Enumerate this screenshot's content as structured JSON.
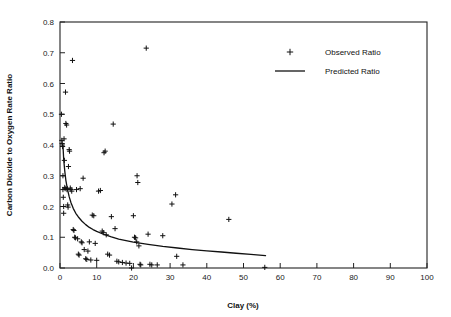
{
  "chart_data": {
    "type": "scatter",
    "title": "",
    "xlabel": "Clay (%)",
    "ylabel": "Carbon Dioxide to Oxygen Rate Ratio",
    "xlim": [
      0,
      100
    ],
    "ylim": [
      0.0,
      0.8
    ],
    "xticks": [
      0,
      10,
      20,
      30,
      40,
      50,
      60,
      70,
      80,
      90,
      100
    ],
    "xtick_labels": [
      "0",
      "10",
      "20",
      "30",
      "40",
      "50",
      "60",
      "70",
      "80",
      "90",
      "100"
    ],
    "yticks": [
      0.0,
      0.1,
      0.2,
      0.3,
      0.4,
      0.5,
      0.6,
      0.7,
      0.8
    ],
    "ytick_labels": [
      "0.0",
      "0.1",
      "0.2",
      "0.3",
      "0.4",
      "0.5",
      "0.6",
      "0.7",
      "0.8"
    ],
    "grid": false,
    "legend_position": "upper-right",
    "frame": true,
    "tick_direction": "in",
    "marker_symbol": "plus",
    "series": [
      {
        "name": "Observed Ratio",
        "type": "scatter",
        "marker": "plus",
        "color": "#111111",
        "points": [
          [
            0.4,
            0.5
          ],
          [
            0.5,
            0.415
          ],
          [
            0.6,
            0.405
          ],
          [
            0.7,
            0.395
          ],
          [
            0.8,
            0.3
          ],
          [
            0.8,
            0.255
          ],
          [
            0.9,
            0.23
          ],
          [
            1.0,
            0.2
          ],
          [
            1.0,
            0.178
          ],
          [
            1.1,
            0.42
          ],
          [
            1.2,
            0.35
          ],
          [
            1.3,
            0.262
          ],
          [
            1.4,
            0.258
          ],
          [
            1.5,
            0.572
          ],
          [
            1.6,
            0.47
          ],
          [
            1.8,
            0.465
          ],
          [
            1.9,
            0.255
          ],
          [
            2.0,
            0.258
          ],
          [
            2.1,
            0.205
          ],
          [
            2.2,
            0.198
          ],
          [
            2.3,
            0.33
          ],
          [
            2.5,
            0.385
          ],
          [
            2.6,
            0.38
          ],
          [
            2.8,
            0.26
          ],
          [
            3.0,
            0.255
          ],
          [
            3.2,
            0.25
          ],
          [
            3.4,
            0.675
          ],
          [
            3.6,
            0.125
          ],
          [
            3.8,
            0.122
          ],
          [
            4.0,
            0.1
          ],
          [
            4.2,
            0.098
          ],
          [
            4.5,
            0.255
          ],
          [
            4.8,
            0.095
          ],
          [
            5.0,
            0.045
          ],
          [
            5.2,
            0.042
          ],
          [
            5.5,
            0.258
          ],
          [
            5.8,
            0.085
          ],
          [
            6.0,
            0.082
          ],
          [
            6.3,
            0.292
          ],
          [
            6.6,
            0.06
          ],
          [
            7.0,
            0.03
          ],
          [
            7.3,
            0.028
          ],
          [
            7.6,
            0.055
          ],
          [
            8.0,
            0.085
          ],
          [
            8.4,
            0.026
          ],
          [
            8.8,
            0.172
          ],
          [
            9.2,
            0.17
          ],
          [
            9.6,
            0.08
          ],
          [
            10.0,
            0.025
          ],
          [
            10.5,
            0.25
          ],
          [
            11.0,
            0.252
          ],
          [
            11.5,
            0.12
          ],
          [
            11.8,
            0.115
          ],
          [
            12.0,
            0.375
          ],
          [
            12.3,
            0.38
          ],
          [
            12.6,
            0.108
          ],
          [
            13.0,
            0.045
          ],
          [
            13.5,
            0.042
          ],
          [
            14.0,
            0.167
          ],
          [
            14.5,
            0.468
          ],
          [
            15.0,
            0.128
          ],
          [
            15.5,
            0.022
          ],
          [
            16.0,
            0.02
          ],
          [
            17.0,
            0.018
          ],
          [
            18.0,
            0.016
          ],
          [
            19.0,
            0.015
          ],
          [
            19.5,
            0.0
          ],
          [
            20.0,
            0.17
          ],
          [
            20.3,
            0.1
          ],
          [
            20.6,
            0.098
          ],
          [
            20.9,
            0.085
          ],
          [
            21.0,
            0.3
          ],
          [
            21.2,
            0.278
          ],
          [
            21.5,
            0.072
          ],
          [
            21.8,
            0.012
          ],
          [
            22.0,
            0.01
          ],
          [
            23.5,
            0.715
          ],
          [
            24.0,
            0.11
          ],
          [
            24.5,
            0.012
          ],
          [
            25.0,
            0.01
          ],
          [
            26.5,
            0.01
          ],
          [
            28.0,
            0.105
          ],
          [
            30.5,
            0.208
          ],
          [
            31.5,
            0.238
          ],
          [
            31.8,
            0.038
          ],
          [
            33.5,
            0.01
          ],
          [
            46.0,
            0.158
          ],
          [
            55.8,
            0.002
          ]
        ]
      },
      {
        "name": "Predicted Ratio",
        "type": "line",
        "color": "#111111",
        "model": "power-decay",
        "x_range": [
          0.8,
          56.0
        ],
        "points": [
          [
            0.8,
            0.4
          ],
          [
            1.0,
            0.355
          ],
          [
            1.3,
            0.315
          ],
          [
            1.6,
            0.285
          ],
          [
            2.0,
            0.258
          ],
          [
            2.5,
            0.232
          ],
          [
            3.0,
            0.212
          ],
          [
            3.6,
            0.194
          ],
          [
            4.3,
            0.178
          ],
          [
            5.0,
            0.166
          ],
          [
            6.0,
            0.152
          ],
          [
            7.0,
            0.141
          ],
          [
            8.0,
            0.132
          ],
          [
            9.0,
            0.125
          ],
          [
            10.0,
            0.119
          ],
          [
            12.0,
            0.109
          ],
          [
            14.0,
            0.101
          ],
          [
            16.0,
            0.094
          ],
          [
            18.0,
            0.089
          ],
          [
            20.0,
            0.084
          ],
          [
            24.0,
            0.077
          ],
          [
            28.0,
            0.07
          ],
          [
            32.0,
            0.065
          ],
          [
            36.0,
            0.06
          ],
          [
            40.0,
            0.056
          ],
          [
            44.0,
            0.052
          ],
          [
            48.0,
            0.048
          ],
          [
            52.0,
            0.044
          ],
          [
            56.0,
            0.04
          ]
        ]
      }
    ],
    "legend_entries": [
      {
        "label": "Observed Ratio",
        "symbol": "plus"
      },
      {
        "label": "Predicted Ratio",
        "symbol": "line"
      }
    ]
  },
  "colors": {
    "ink": "#111111",
    "axis": "#222222",
    "background": "#ffffff"
  }
}
